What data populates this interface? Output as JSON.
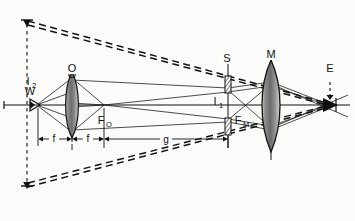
{
  "figure": {
    "kind": "optical-ray-diagram",
    "background_color": "#fbfbf9",
    "ink_color": "#111111",
    "lens_fill_color": "#8d8d8d",
    "width": 355,
    "height": 221
  },
  "labels": {
    "source": "W",
    "objective_lens": "O",
    "image_two": "I",
    "image_two_sub": "2",
    "image_one": "I",
    "image_one_sub": "1",
    "stop": "S",
    "magnifier_lens": "M",
    "eye": "E",
    "focal_objective": "F",
    "focal_objective_sub": "O",
    "focal_magnifier": "F",
    "focal_magnifier_sub": "M"
  },
  "dimensions": {
    "focal_left": "f",
    "focal_right": "f",
    "image_distance": "g"
  },
  "icons": {
    "source_symbol": "lamp-source-icon",
    "eye_symbol": "eye-icon",
    "stop_upper": "aperture-blade-icon",
    "stop_lower": "aperture-blade-icon"
  },
  "geometry": {
    "axis_y": 105,
    "axis_x_start": 4,
    "axis_x_end": 350,
    "source_x": 34,
    "objective_x": 72,
    "focal_objective_x": 104,
    "stop_x": 228,
    "magnifier_x": 271,
    "eye_x": 330,
    "i2_line_x": 27,
    "i2_top_y": 20,
    "i2_bottom_y": 188
  }
}
